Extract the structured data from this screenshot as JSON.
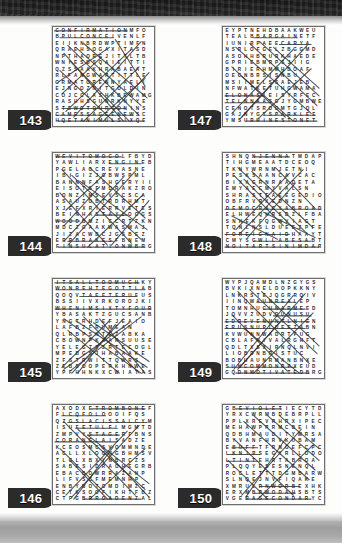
{
  "page": {
    "background_color": "#fdfdfc",
    "top_band_color": "#222222",
    "bottom_band_color": "#a9a9a9",
    "tab_color": "#2b2b2b",
    "tab_text_color": "#ffffff",
    "grid_border_color": "#6e6e6e",
    "letter_color": "#262626",
    "strike_color": "#333333"
  },
  "puzzles": [
    {
      "number": "143",
      "theme_words": [
        "CONFIRMATION",
        "CONCEIVED",
        "MESSAGE",
        "NEWS",
        "ANIMUS",
        "UNTO",
        "JOURNEY"
      ],
      "rows": [
        "CONFIRMATIONMFO",
        "BPULCONCEIVENLF",
        "EIIKNBRDWPTIMFN",
        "QRAEHSOGAXITASD",
        "NPTHAOREJITTLTB",
        "WNIESBSQAIEITTI",
        "QZSSAAKHRABAEAT",
        "RLFANGWARTITTLE",
        "GRMATORENNYAELI",
        "EJNGOZNITGOLDIN",
        "COJCCLASHKBEWAMG",
        "RASHHSGUNRKNYYE",
        "STEWGTOURTONINS",
        "CAMESSAGEENEWSC",
        "HQETANIMULSIXQE"
      ],
      "strikes": [
        [
          0.5,
          3.0,
          74.0,
          3.0
        ],
        [
          6.0,
          10.0,
          60.0,
          10.0
        ],
        [
          2.0,
          90.0,
          80.0,
          90.0
        ],
        [
          4.0,
          96.0,
          90.0,
          96.0
        ],
        [
          8.0,
          83.0,
          72.0,
          83.0
        ],
        [
          14.0,
          18.0,
          86.0,
          90.0
        ],
        [
          88.0,
          14.0,
          20.0,
          92.0
        ],
        [
          10.0,
          26.0,
          70.0,
          96.0
        ],
        [
          78.0,
          22.0,
          12.0,
          86.0
        ],
        [
          22.0,
          20.0,
          88.0,
          80.0
        ],
        [
          6.0,
          44.0,
          60.0,
          96.0
        ],
        [
          86.0,
          40.0,
          30.0,
          96.0
        ],
        [
          30.0,
          16.0,
          94.0,
          72.0
        ],
        [
          4.0,
          56.0,
          56.0,
          20.0
        ],
        [
          50.0,
          96.0,
          96.0,
          46.0
        ],
        [
          8.0,
          68.0,
          48.0,
          30.0
        ],
        [
          62.0,
          12.0,
          92.0,
          60.0
        ],
        [
          16.0,
          34.0,
          76.0,
          96.0
        ],
        [
          92.0,
          52.0,
          42.0,
          96.0
        ]
      ]
    },
    {
      "number": "144",
      "theme_words": [
        "LOCOMOTIVE",
        "ENGINE",
        "WOOD",
        "BRAKES",
        "INSULATION",
        "TAYLOR"
      ],
      "rows": [
        "WEVITOMOCOLFBYD",
        "YAWLIARXENGINEB",
        "PGELAOCREVASNE",
        "IBIGIZJGBWSPML",
        "BANNNFASHGERYII",
        "EISOTSFMDRAKZRO",
        "BONZIMSEVSCSCA",
        "ASAUZOBTRDRHMT",
        "XJEFXRIERRVETES",
        "BEINHASTAYLOGGS",
        "WOODBMZICCRTZKN",
        "MDCZGAAKWASMAJ",
        "JIZACWBCJGSBEZ",
        "ERRBRAKESFBNEM",
        "FINSULATIONWBRG"
      ],
      "strikes": [
        [
          2.0,
          3.0,
          68.0,
          3.0
        ],
        [
          4.0,
          96.0,
          92.0,
          96.0
        ],
        [
          2.0,
          69.0,
          26.0,
          69.0
        ],
        [
          56.0,
          10.0,
          88.0,
          10.0
        ],
        [
          14.0,
          90.0,
          60.0,
          90.0
        ],
        [
          44.0,
          63.0,
          74.0,
          63.0
        ],
        [
          8.0,
          16.0,
          78.0,
          92.0
        ],
        [
          82.0,
          18.0,
          14.0,
          94.0
        ],
        [
          18.0,
          22.0,
          88.0,
          88.0
        ],
        [
          70.0,
          24.0,
          10.0,
          90.0
        ],
        [
          6.0,
          40.0,
          54.0,
          94.0
        ],
        [
          90.0,
          42.0,
          34.0,
          96.0
        ],
        [
          26.0,
          28.0,
          94.0,
          78.0
        ],
        [
          12.0,
          58.0,
          52.0,
          20.0
        ],
        [
          58.0,
          94.0,
          96.0,
          48.0
        ],
        [
          36.0,
          14.0,
          92.0,
          66.0
        ],
        [
          10.0,
          74.0,
          46.0,
          34.0
        ]
      ]
    },
    {
      "number": "145",
      "theme_words": [
        "ITS ALL TOO MUCH",
        "GOT TO GET HER",
        "WHEN IM SIXTY FOUR",
        "TAXMAN",
        "GET BACK"
      ],
      "rows": [
        "ITSALLTOOMUCHKY",
        "WONREHTEGOTTLAB",
        "QOQVTAEETERUFUS",
        "BSSIIVXRKOROJKI",
        "WHENIMSIXTYFOUR",
        "YBASAKTZGUCSANB",
        "YNGTRHDEFJEAIO",
        "LAFBZFRUMEAN",
        "QLRBPSNTEZABKA",
        "CBOWNPKXARSUUSE",
        "YELEGZTZRTECOGL",
        "MPEBGSJHABAAKE",
        "ZFSTRWITTQWRS",
        "ZEBSOOPERKHNWE",
        "YPFHHNKXCWIATAS"
      ],
      "strikes": [
        [
          1.0,
          3.0,
          86.0,
          3.0
        ],
        [
          2.0,
          10.0,
          92.0,
          10.0
        ],
        [
          26.0,
          17.0,
          84.0,
          17.0
        ],
        [
          1.0,
          30.0,
          98.0,
          30.0
        ],
        [
          10.0,
          40.0,
          88.0,
          96.0
        ],
        [
          88.0,
          38.0,
          16.0,
          94.0
        ],
        [
          22.0,
          42.0,
          94.0,
          90.0
        ],
        [
          76.0,
          44.0,
          10.0,
          92.0
        ],
        [
          30.0,
          38.0,
          86.0,
          96.0
        ],
        [
          70.0,
          40.0,
          18.0,
          96.0
        ],
        [
          40.0,
          44.0,
          96.0,
          84.0
        ],
        [
          56.0,
          42.0,
          8.0,
          90.0
        ],
        [
          46.0,
          40.0,
          92.0,
          96.0
        ],
        [
          62.0,
          46.0,
          24.0,
          96.0
        ],
        [
          14.0,
          52.0,
          66.0,
          96.0
        ]
      ]
    },
    {
      "number": "146",
      "theme_words": [
        "TROMBONE",
        "CLASSICAL",
        "FLUTE",
        "STAGE",
        "CADENZA",
        "ORANGLAIS"
      ],
      "rows": [
        "AXODXETROMBONEF",
        "FLCQFOLOOOIFQS",
        "QZGSLACISSALCYM",
        "ISUFETULFLMGMTD",
        "ZMPVYSTAGERFBNS",
        "CORANGLAISADZE",
        "KCEOSMCSVOMMNDE",
        "ACLLXLOONGBHMSV",
        "TLGLXBXYNBRCZS",
        "SABESIDRAOHEGRB",
        "EBACBOWRRAZANP",
        "LIFVSCFMEMNHP",
        "ENBYBOTOMDIMZC",
        "CETKSOOFIKHTFBZ",
        "CTPGBRROADENZAL"
      ],
      "strikes": [
        [
          38.0,
          3.0,
          92.0,
          3.0
        ],
        [
          14.0,
          17.0,
          94.0,
          17.0
        ],
        [
          22.0,
          23.0,
          62.0,
          23.0
        ],
        [
          34.0,
          30.0,
          66.0,
          30.0
        ],
        [
          1.0,
          37.0,
          62.0,
          37.0
        ],
        [
          30.0,
          96.0,
          88.0,
          96.0
        ],
        [
          8.0,
          10.0,
          52.0,
          10.0
        ],
        [
          10.0,
          16.0,
          82.0,
          92.0
        ],
        [
          86.0,
          20.0,
          18.0,
          94.0
        ],
        [
          24.0,
          24.0,
          92.0,
          86.0
        ],
        [
          74.0,
          26.0,
          12.0,
          92.0
        ],
        [
          6.0,
          44.0,
          58.0,
          96.0
        ],
        [
          92.0,
          44.0,
          36.0,
          96.0
        ],
        [
          34.0,
          30.0,
          96.0,
          80.0
        ],
        [
          46.0,
          40.0,
          96.0,
          94.0
        ],
        [
          60.0,
          42.0,
          20.0,
          96.0
        ],
        [
          16.0,
          56.0,
          54.0,
          96.0
        ]
      ]
    },
    {
      "number": "147",
      "theme_words": [
        "SPARKLE",
        "RHINESTONE",
        "BARGAIN",
        "CARAT",
        "ROOMS",
        "ELONAS"
      ],
      "rows": [
        "EYPTNEHDBAAKWEU",
        "TEALBBARGAINETF",
        "IUNIRPAEECARYA",
        "NSRLOFGELZBGGMD",
        "ASOHHBRURKHAEDE",
        "GPRIEBMRPSJIIG",
        "BIRIERHMMHDOAF",
        "OEGNBRSISNBU",
        "MSIIMELSSAEJEB",
        "NFWATKETUHGWAMA",
        "ELONASIEISYRFEC",
        "TELNNAASGJYGMBWE",
        "CENOTSROOMTGJQL",
        "GAJNYGTSPARKLEE",
        "YMSURHINESTONET"
      ],
      "strikes": [
        [
          30.0,
          10.0,
          74.0,
          10.0
        ],
        [
          56.0,
          17.0,
          88.0,
          17.0
        ],
        [
          1.0,
          70.0,
          40.0,
          70.0
        ],
        [
          1.0,
          77.0,
          46.0,
          77.0
        ],
        [
          40.0,
          90.0,
          92.0,
          90.0
        ],
        [
          22.0,
          96.0,
          94.0,
          96.0
        ],
        [
          12.0,
          20.0,
          88.0,
          88.0
        ],
        [
          84.0,
          18.0,
          18.0,
          92.0
        ],
        [
          26.0,
          16.0,
          94.0,
          80.0
        ],
        [
          70.0,
          22.0,
          8.0,
          88.0
        ],
        [
          8.0,
          40.0,
          62.0,
          92.0
        ],
        [
          88.0,
          42.0,
          34.0,
          94.0
        ],
        [
          36.0,
          14.0,
          96.0,
          70.0
        ],
        [
          50.0,
          20.0,
          96.0,
          62.0
        ],
        [
          18.0,
          50.0,
          70.0,
          96.0
        ],
        [
          60.0,
          44.0,
          16.0,
          94.0
        ]
      ]
    },
    {
      "number": "148",
      "theme_words": [
        "DEMOCRACY ABROAD",
        "FOREIGN AID",
        "ADMINISTRATION",
        "JENNA",
        "EMBASSY"
      ],
      "rows": [
        "SHNQNJENNATMDAP",
        "TIHGMEAATDCEOQ",
        "TKNYWRNMJETNI",
        "PESKSAANCAVCAC",
        "BIXAGRNRAADETA",
        "EMYAECMYVALSN",
        "SHRASTEAEEGEDIO",
        "OBFRVRXEDNZN",
        "DEMOCRACYABROAD",
        "ELHWEQHRSDZLFBA",
        "SNHEKFQGWVIAGT",
        "TQNLNSLDUEEZPFE",
        "FOREIGNAIDHAAYT",
        "CMYSGWLLABESABT",
        "NOITARTSINIMDAR"
      ],
      "strikes": [
        [
          30.0,
          3.0,
          66.0,
          3.0
        ],
        [
          1.0,
          57.0,
          98.0,
          57.0
        ],
        [
          1.0,
          83.0,
          66.0,
          83.0
        ],
        [
          30.0,
          90.0,
          88.0,
          90.0
        ],
        [
          1.0,
          96.0,
          96.0,
          96.0
        ],
        [
          14.0,
          14.0,
          82.0,
          80.0
        ],
        [
          80.0,
          16.0,
          16.0,
          82.0
        ],
        [
          28.0,
          18.0,
          90.0,
          76.0
        ],
        [
          66.0,
          20.0,
          12.0,
          78.0
        ],
        [
          10.0,
          22.0,
          60.0,
          74.0
        ],
        [
          52.0,
          14.0,
          92.0,
          56.0
        ],
        [
          20.0,
          26.0,
          76.0,
          82.0
        ],
        [
          72.0,
          30.0,
          24.0,
          86.0
        ],
        [
          40.0,
          60.0,
          92.0,
          86.0
        ],
        [
          8.0,
          64.0,
          54.0,
          88.0
        ]
      ]
    },
    {
      "number": "149",
      "theme_words": [
        "UNREAL",
        "UNARMED",
        "UNCOMMON",
        "UNMOTIVATED",
        "UNTIL",
        "UNUSUAL"
      ],
      "rows": [
        "WYPJQAMDLNZGYGS",
        "BVKIXNELDOPKKNY",
        "LNKRSTEJQGRRQIV",
        "IINQWAUNREALEP",
        "TOMNHUCUNARMEED",
        "JQVVZUDVOUNUSU",
        "EDREVENUNTLNIEN",
        "ERUSNUPLUEEZABN",
        "KVWUNNWADRTFUG",
        "CBLAFNIVALRGHFT",
        "QDLTXSXIRNQLNVI",
        "LIOBDNBRISTUC",
        "BOBHAUNRMANBNXE",
        "SUNCOMMONRPXEUD",
        "GQDNMOTIVATEDBRG"
      ],
      "strikes": [
        [
          1.0,
          43.0,
          86.0,
          43.0
        ],
        [
          1.0,
          50.0,
          82.0,
          50.0
        ],
        [
          34.0,
          23.0,
          72.0,
          23.0
        ],
        [
          40.0,
          30.0,
          82.0,
          30.0
        ],
        [
          50.0,
          37.0,
          88.0,
          37.0
        ],
        [
          4.0,
          90.0,
          72.0,
          90.0
        ],
        [
          12.0,
          96.0,
          86.0,
          96.0
        ],
        [
          14.0,
          12.0,
          86.0,
          86.0
        ],
        [
          82.0,
          14.0,
          16.0,
          90.0
        ],
        [
          26.0,
          10.0,
          94.0,
          76.0
        ],
        [
          70.0,
          16.0,
          10.0,
          92.0
        ],
        [
          8.0,
          36.0,
          64.0,
          94.0
        ],
        [
          90.0,
          34.0,
          30.0,
          96.0
        ],
        [
          38.0,
          12.0,
          96.0,
          68.0
        ],
        [
          20.0,
          50.0,
          76.0,
          96.0
        ],
        [
          58.0,
          42.0,
          14.0,
          92.0
        ]
      ]
    },
    {
      "number": "150",
      "theme_words": [
        "VIOLET",
        "BUFF",
        "PINK",
        "TINT",
        "BROWN",
        "SHADOW",
        "SECONDARY"
      ],
      "rows": [
        "GBEVIOLETIECYTD",
        "YRXCWRMBDEBRPLL",
        "PPLXREVRHRXIPEC",
        "MEHAWPPRMCBEIN",
        "QDBHMAUDITYMRSA",
        "BYVANFHRVKUBAM",
        "EBUFFTFRNGEFCPC",
        "LKNIPSEGYRLLODO",
        "LTINTEHRTABROA",
        "PLQQYESESNENQL",
        "ROCLETTTDGMBARW",
        "SLNQEJNVFIQAKE",
        "XMRULRNWORBEXHK",
        "ERXMBPWODAHSBTS",
        "VGERASECONDARYC"
      ],
      "strikes": [
        [
          12.0,
          3.0,
          58.0,
          3.0
        ],
        [
          8.0,
          43.0,
          34.0,
          43.0
        ],
        [
          4.0,
          50.0,
          36.0,
          50.0
        ],
        [
          4.0,
          57.0,
          34.0,
          57.0
        ],
        [
          36.0,
          83.0,
          76.0,
          83.0
        ],
        [
          30.0,
          90.0,
          72.0,
          90.0
        ],
        [
          22.0,
          96.0,
          88.0,
          96.0
        ],
        [
          30.0,
          10.0,
          92.0,
          66.0
        ],
        [
          44.0,
          10.0,
          96.0,
          56.0
        ],
        [
          20.0,
          16.0,
          86.0,
          76.0
        ],
        [
          56.0,
          10.0,
          96.0,
          44.0
        ],
        [
          10.0,
          34.0,
          70.0,
          92.0
        ],
        [
          4.0,
          56.0,
          44.0,
          96.0
        ],
        [
          90.0,
          40.0,
          34.0,
          96.0
        ],
        [
          78.0,
          24.0,
          18.0,
          92.0
        ],
        [
          62.0,
          34.0,
          22.0,
          94.0
        ]
      ]
    }
  ]
}
